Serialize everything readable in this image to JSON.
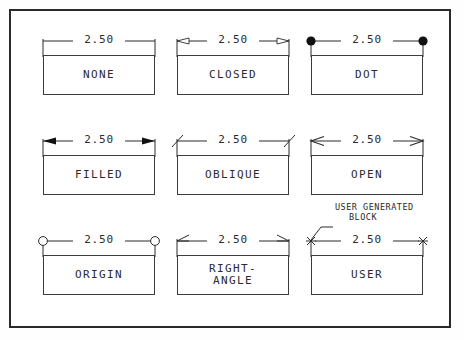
{
  "drawing": {
    "title": "Dimension Arrowhead Styles",
    "dimension_value": "2.50",
    "line_color": "#2b2b2b",
    "frame_color": "#2a2a2a",
    "background": "#ffffff"
  },
  "annotation": {
    "line1": "USER GENERATED",
    "line2": "BLOCK"
  },
  "cells": [
    {
      "label": "NONE",
      "terminator": "none",
      "dim": "2.50",
      "row": 0,
      "col": 0
    },
    {
      "label": "CLOSED",
      "terminator": "closed",
      "dim": "2.50",
      "row": 0,
      "col": 1
    },
    {
      "label": "DOT",
      "terminator": "dot",
      "dim": "2.50",
      "row": 0,
      "col": 2
    },
    {
      "label": "FILLED",
      "terminator": "filled",
      "dim": "2.50",
      "row": 1,
      "col": 0
    },
    {
      "label": "OBLIQUE",
      "terminator": "oblique",
      "dim": "2.50",
      "row": 1,
      "col": 1
    },
    {
      "label": "OPEN",
      "terminator": "open",
      "dim": "2.50",
      "row": 1,
      "col": 2
    },
    {
      "label": "ORIGIN",
      "terminator": "origin",
      "dim": "2.50",
      "row": 2,
      "col": 0
    },
    {
      "label": "RIGHT-\nANGLE",
      "terminator": "right-angle",
      "dim": "2.50",
      "row": 2,
      "col": 1
    },
    {
      "label": "USER",
      "terminator": "user",
      "dim": "2.50",
      "row": 2,
      "col": 2
    }
  ]
}
